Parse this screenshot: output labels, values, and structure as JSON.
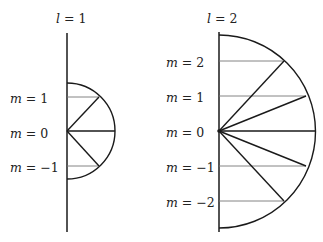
{
  "diagrams": [
    {
      "title": {
        "var": "l",
        "eq": " = ",
        "val": "1"
      },
      "labels": [
        {
          "var": "m",
          "eq": " = ",
          "val": "1"
        },
        {
          "var": "m",
          "eq": " = ",
          "val": "0"
        },
        {
          "var": "m",
          "eq": " = ",
          "val": "−1"
        }
      ]
    },
    {
      "title": {
        "var": "l",
        "eq": " = ",
        "val": "2"
      },
      "labels": [
        {
          "var": "m",
          "eq": " = ",
          "val": "2"
        },
        {
          "var": "m",
          "eq": " = ",
          "val": "1"
        },
        {
          "var": "m",
          "eq": " = ",
          "val": "0"
        },
        {
          "var": "m",
          "eq": " = ",
          "val": "−1"
        },
        {
          "var": "m",
          "eq": " = ",
          "val": "−2"
        }
      ]
    }
  ]
}
